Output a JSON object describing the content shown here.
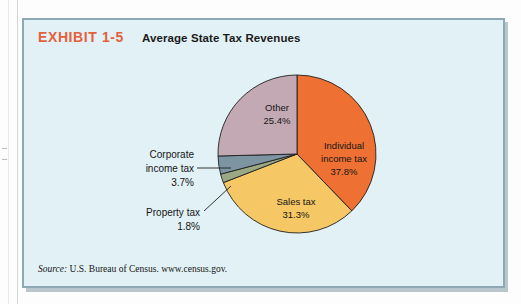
{
  "exhibit": {
    "number": "EXHIBIT 1-5",
    "title": "Average State Tax Revenues",
    "source_word": "Source:",
    "source_text": " U.S. Bureau of Census. www.census.gov.",
    "panel_bg": "#E2F1F5",
    "panel_border": "#8FA9B4",
    "number_color": "#E4603A"
  },
  "chart_data": {
    "type": "pie",
    "title": "Average State Tax Revenues",
    "subtitle": "",
    "xlabel": "",
    "ylabel": "",
    "legend_position": "none",
    "grid": false,
    "start_angle_deg": 0,
    "direction": "clockwise",
    "units": "percent",
    "categories": [
      "Individual income tax",
      "Sales tax",
      "Property tax",
      "Corporate income tax",
      "Other"
    ],
    "values": [
      37.8,
      31.3,
      1.8,
      3.7,
      25.4
    ],
    "colors": [
      "#EE7033",
      "#F6C765",
      "#9AA884",
      "#7D95A3",
      "#C3A9B3"
    ],
    "slices": [
      {
        "name": "Individual income tax",
        "value": 37.8,
        "label_line1": "Individual",
        "label_line2": "income tax",
        "label_value": "37.8%",
        "color": "#EE7033",
        "label_placement": "inside"
      },
      {
        "name": "Sales tax",
        "value": 31.3,
        "label_line1": "Sales tax",
        "label_line2": "",
        "label_value": "31.3%",
        "color": "#F6C765",
        "label_placement": "inside"
      },
      {
        "name": "Property tax",
        "value": 1.8,
        "label_line1": "Property tax",
        "label_line2": "",
        "label_value": "1.8%",
        "color": "#9AA884",
        "label_placement": "callout"
      },
      {
        "name": "Corporate income tax",
        "value": 3.7,
        "label_line1": "Corporate",
        "label_line2": "income tax",
        "label_value": "3.7%",
        "color": "#7D95A3",
        "label_placement": "callout"
      },
      {
        "name": "Other",
        "value": 25.4,
        "label_line1": "Other",
        "label_line2": "",
        "label_value": "25.4%",
        "color": "#C3A9B3",
        "label_placement": "inside"
      }
    ]
  }
}
